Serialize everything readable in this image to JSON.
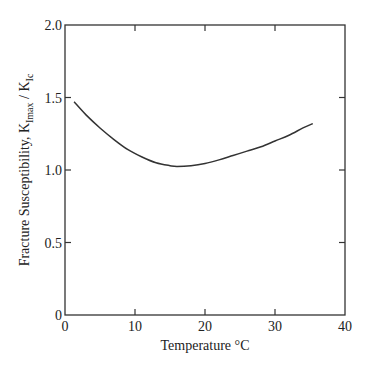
{
  "chart_data": {
    "type": "line",
    "title": "",
    "xlabel": "Temperature °C",
    "ylabel": "Fracture Susceptibility, K",
    "ylabel_parts": {
      "prefix": "Fracture Susceptibility, K",
      "sub1": "Imax",
      "mid": " / K",
      "sub2": "Ic"
    },
    "xlim": [
      0,
      40
    ],
    "ylim": [
      0,
      2.0
    ],
    "xticks": [
      0,
      10,
      20,
      30,
      40
    ],
    "xtick_labels": [
      "0",
      "10",
      "20",
      "30",
      "40"
    ],
    "yticks": [
      0,
      0.5,
      1.0,
      1.5,
      2.0
    ],
    "ytick_labels": [
      "0",
      "0.5",
      "1.0",
      "1.5",
      "2.0"
    ],
    "grid": false,
    "legend": null,
    "series": [
      {
        "name": "K_Imax / K_Ic",
        "color": "#333333",
        "x": [
          1.3,
          3,
          5,
          7,
          9,
          11,
          13,
          15,
          16,
          18,
          20,
          22,
          24,
          26,
          28,
          30,
          32,
          34,
          35.4
        ],
        "y": [
          1.47,
          1.38,
          1.29,
          1.21,
          1.14,
          1.09,
          1.05,
          1.03,
          1.025,
          1.03,
          1.045,
          1.07,
          1.1,
          1.13,
          1.16,
          1.2,
          1.24,
          1.29,
          1.32
        ]
      }
    ]
  },
  "colors": {
    "axis": "#333333",
    "line": "#333333",
    "background": "#ffffff"
  }
}
